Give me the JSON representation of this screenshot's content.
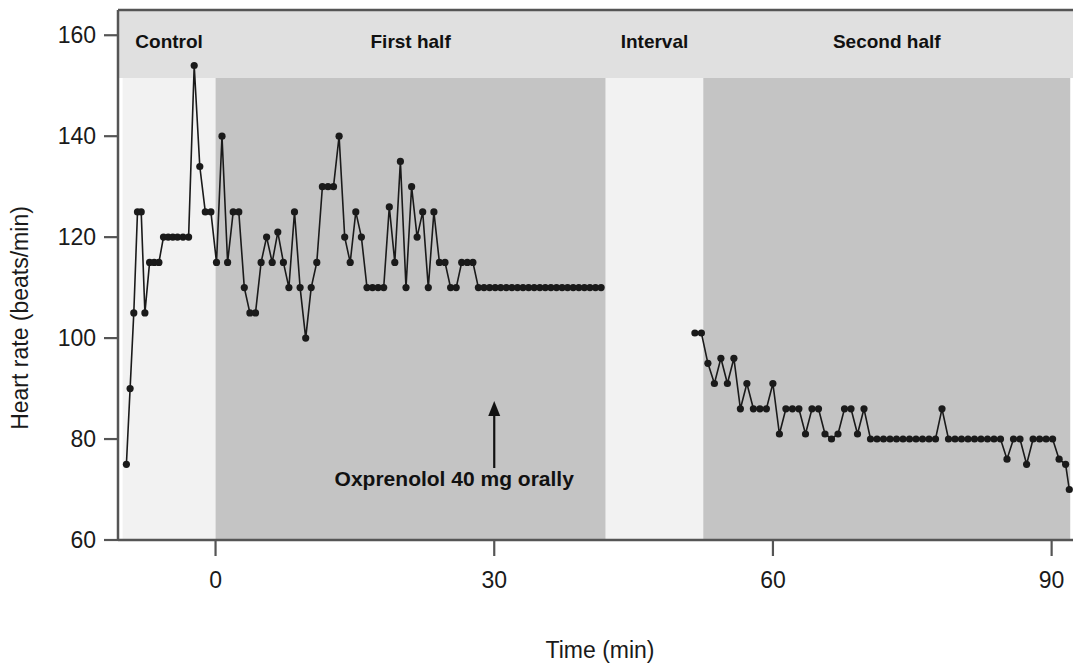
{
  "figure": {
    "background": "#ffffff",
    "plot_frame_color": "#555555",
    "band_light_color": "#f2f2f2",
    "band_dark_color": "#c4c4c4",
    "header_band_color": "#e0e0e0",
    "series_color": "#1a1a1a"
  },
  "axes": {
    "y_label": "Heart rate (beats/min)",
    "x_label": "Time (min)",
    "y_ticks": [
      "60",
      "80",
      "100",
      "120",
      "140",
      "160"
    ],
    "x_ticks": [
      "0",
      "30",
      "60",
      "90"
    ]
  },
  "annotation": {
    "text": "Oxprenolol 40 mg orally",
    "arrow_at_minutes": 30
  },
  "phases": [
    {
      "label": "Control",
      "start_min": -10,
      "end_min": 0,
      "shade": "light"
    },
    {
      "label": "First half",
      "start_min": 0,
      "end_min": 42,
      "shade": "dark"
    },
    {
      "label": "Interval",
      "start_min": 42,
      "end_min": 52.5,
      "shade": "light"
    },
    {
      "label": "Second half",
      "start_min": 52.5,
      "end_min": 92,
      "shade": "dark"
    }
  ],
  "chart_data": {
    "type": "line",
    "title": "",
    "subtitle": "",
    "xlabel": "Time (min)",
    "ylabel": "Heart rate (beats/min)",
    "xlim": [
      -10.5,
      92.3
    ],
    "ylim": [
      60,
      165
    ],
    "y_ticks": [
      60,
      80,
      100,
      120,
      140,
      160
    ],
    "x_ticks": [
      0,
      30,
      60,
      90
    ],
    "grid": false,
    "legend": null,
    "marker": "filled-circle",
    "annotations": [
      {
        "text": "Control",
        "type": "phase-band-label",
        "x": -5
      },
      {
        "text": "First half",
        "type": "phase-band-label",
        "x": 21
      },
      {
        "text": "Interval",
        "type": "phase-band-label",
        "x": 47
      },
      {
        "text": "Second half",
        "type": "phase-band-label",
        "x": 72
      },
      {
        "text": "Oxprenolol 40 mg orally",
        "type": "arrow-label",
        "x": 30,
        "y": 95
      }
    ],
    "series": [
      {
        "name": "Heart rate",
        "x": [
          -9.6,
          -9.2,
          -8.8,
          -8.4,
          -8.0,
          -7.6,
          -7.1,
          -6.6,
          -6.1,
          -5.6,
          -5.1,
          -4.6,
          -4.1,
          -3.5,
          -2.9,
          -2.3,
          -1.7,
          -1.1,
          -0.5,
          0.1,
          0.7,
          1.3,
          1.9,
          2.5,
          3.1,
          3.7,
          4.3,
          4.9,
          5.5,
          6.1,
          6.7,
          7.3,
          7.9,
          8.5,
          9.1,
          9.7,
          10.3,
          10.9,
          11.5,
          12.1,
          12.7,
          13.3,
          13.9,
          14.5,
          15.1,
          15.7,
          16.3,
          16.9,
          17.5,
          18.1,
          18.7,
          19.3,
          19.9,
          20.5,
          21.1,
          21.7,
          22.3,
          22.9,
          23.5,
          24.1,
          24.7,
          25.3,
          25.9,
          26.5,
          27.1,
          27.7,
          28.3,
          28.9,
          29.5,
          30.1,
          30.7,
          31.3,
          31.9,
          32.5,
          33.1,
          33.7,
          34.3,
          34.9,
          35.5,
          36.1,
          36.7,
          37.3,
          37.9,
          38.5,
          39.1,
          39.7,
          40.3,
          40.9,
          41.5,
          51.6,
          52.3,
          53.0,
          53.7,
          54.4,
          55.1,
          55.8,
          56.5,
          57.2,
          57.9,
          58.6,
          59.3,
          60.0,
          60.7,
          61.4,
          62.1,
          62.8,
          63.5,
          64.2,
          64.9,
          65.6,
          66.3,
          67.0,
          67.7,
          68.4,
          69.1,
          69.8,
          70.5,
          71.2,
          71.9,
          72.6,
          73.3,
          74.0,
          74.7,
          75.4,
          76.1,
          76.8,
          77.5,
          78.2,
          78.9,
          79.6,
          80.3,
          81.0,
          81.7,
          82.4,
          83.1,
          83.8,
          84.5,
          85.2,
          85.9,
          86.6,
          87.3,
          88.0,
          88.7,
          89.4,
          90.1,
          90.8,
          91.5,
          91.9
        ],
        "y": [
          75,
          90,
          105,
          125,
          125,
          105,
          115,
          115,
          115,
          120,
          120,
          120,
          120,
          120,
          120,
          154,
          134,
          125,
          125,
          115,
          140,
          115,
          125,
          125,
          110,
          105,
          105,
          115,
          120,
          115,
          121,
          115,
          110,
          125,
          110,
          100,
          110,
          115,
          130,
          130,
          130,
          140,
          120,
          115,
          125,
          120,
          110,
          110,
          110,
          110,
          126,
          115,
          135,
          110,
          130,
          120,
          125,
          110,
          125,
          115,
          115,
          110,
          110,
          115,
          115,
          115,
          110,
          110,
          110,
          110,
          110,
          110,
          110,
          110,
          110,
          110,
          110,
          110,
          110,
          110,
          110,
          110,
          110,
          110,
          110,
          110,
          110,
          110,
          110,
          101,
          101,
          95,
          91,
          96,
          91,
          96,
          86,
          91,
          86,
          86,
          86,
          91,
          81,
          86,
          86,
          86,
          81,
          86,
          86,
          81,
          80,
          81,
          86,
          86,
          81,
          86,
          80,
          80,
          80,
          80,
          80,
          80,
          80,
          80,
          80,
          80,
          80,
          86,
          80,
          80,
          80,
          80,
          80,
          80,
          80,
          80,
          80,
          76,
          80,
          80,
          75,
          80,
          80,
          80,
          80,
          76,
          75,
          70
        ]
      }
    ]
  }
}
